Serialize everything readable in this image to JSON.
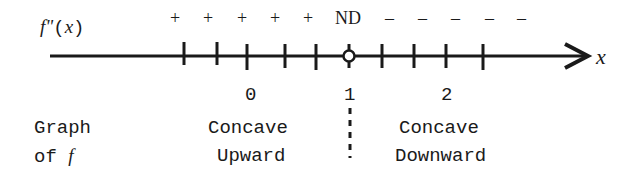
{
  "diagram": {
    "row_label": {
      "func": "f\"",
      "arg": "(x)"
    },
    "axis_label": "x",
    "signs": [
      "+",
      "+",
      "+",
      "+",
      "+",
      "ND",
      "–",
      "–",
      "–",
      "–",
      "–"
    ],
    "tick_labels": [
      {
        "text": "0",
        "x": 252
      },
      {
        "text": "1",
        "x": 349
      },
      {
        "text": "2",
        "x": 447
      }
    ],
    "graph_label": {
      "line1": "Graph",
      "line2_prefix": "of ",
      "line2_func": "f"
    },
    "regions": [
      {
        "line1": "Concave",
        "line2": "Upward"
      },
      {
        "line1": "Concave",
        "line2": "Downward"
      }
    ],
    "critical_point": {
      "x_value": "1",
      "marker": "open-circle",
      "note": "ND"
    },
    "colors": {
      "ink": "#1a1a1a",
      "background": "#ffffff"
    }
  }
}
